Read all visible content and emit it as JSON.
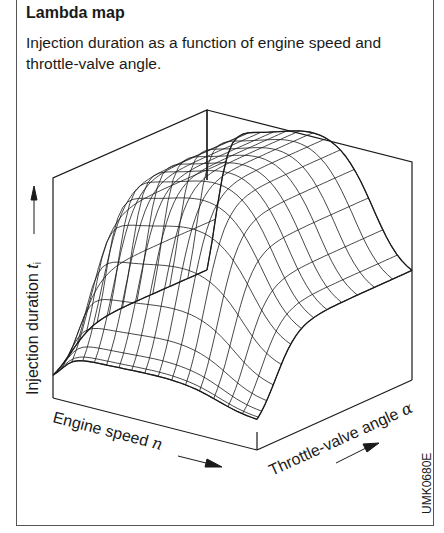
{
  "header": {
    "title": "Lambda map",
    "subtitle": "Injection duration as a function of engine speed and throttle-valve angle."
  },
  "diagram": {
    "type": "3d-surface-wireframe",
    "axes": {
      "z_label": "Injection duration",
      "z_symbol": "t",
      "z_subscript": "i",
      "x_label": "Engine speed",
      "x_symbol": "n",
      "y_label": "Throttle-valve angle",
      "y_symbol": "α"
    },
    "figure_code": "UMK0680E",
    "colors": {
      "line": "#1a1a1a",
      "background": "#ffffff",
      "frame": "#555555"
    },
    "mesh": {
      "speed_lines": 16,
      "throttle_lines": 14
    }
  }
}
